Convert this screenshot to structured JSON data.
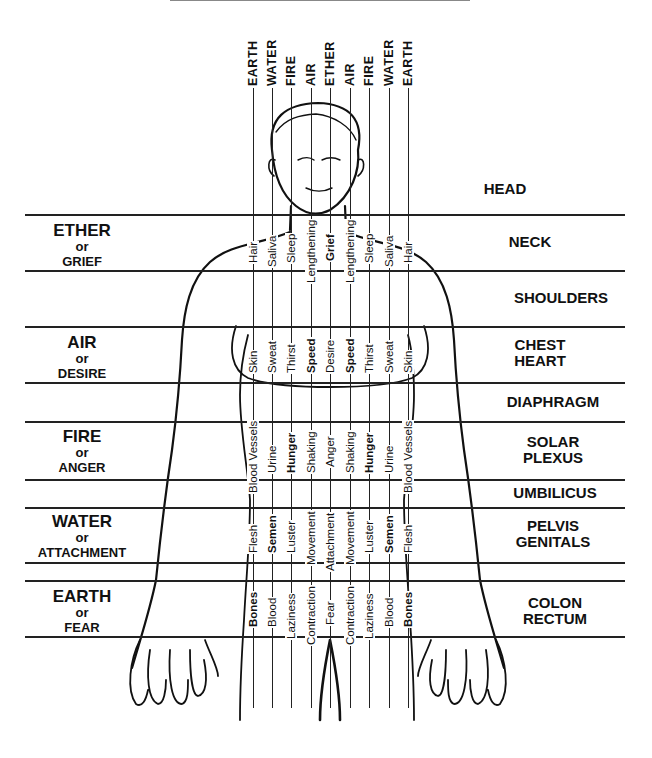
{
  "top_element_labels": [
    "EARTH",
    "WATER",
    "FIRE",
    "AIR",
    "ETHER",
    "AIR",
    "FIRE",
    "WATER",
    "EARTH"
  ],
  "columns_x": [
    253,
    272,
    291,
    311,
    330,
    350,
    369,
    389,
    408
  ],
  "horizontal_lines_y": [
    214,
    270,
    326,
    382,
    421,
    479,
    507,
    562,
    580,
    636
  ],
  "left_labels": [
    {
      "element": "ETHER",
      "or": "or",
      "emotion": "GRIEF",
      "y": 222
    },
    {
      "element": "AIR",
      "or": "or",
      "emotion": "DESIRE",
      "y": 334
    },
    {
      "element": "FIRE",
      "or": "or",
      "emotion": "ANGER",
      "y": 428
    },
    {
      "element": "WATER",
      "or": "or",
      "emotion": "ATTACHMENT",
      "y": 513
    },
    {
      "element": "EARTH",
      "or": "or",
      "emotion": "FEAR",
      "y": 588
    }
  ],
  "right_labels": [
    {
      "text": "HEAD",
      "y": 180
    },
    {
      "text": "NECK",
      "y": 234
    },
    {
      "text": "SHOULDERS",
      "y": 290
    },
    {
      "text": "CHEST\nHEART",
      "y": 338
    },
    {
      "text": "DIAPHRAGM",
      "y": 394
    },
    {
      "text": "SOLAR\nPLEXUS",
      "y": 435
    },
    {
      "text": "UMBILICUS",
      "y": 485
    },
    {
      "text": "PELVIS\nGENITALS",
      "y": 515
    },
    {
      "text": "COLON\nRECTUM",
      "y": 593
    }
  ],
  "bands": [
    {
      "name": "ether",
      "y_bottom": 268,
      "labels": [
        "Hair",
        "Saliva",
        "Sleep",
        "Lengthening",
        "Grief",
        "Lengthening",
        "Sleep",
        "Saliva",
        "Hair"
      ],
      "bold": [
        false,
        false,
        false,
        false,
        true,
        false,
        false,
        false,
        false
      ]
    },
    {
      "name": "air",
      "y_bottom": 382,
      "labels": [
        "Skin",
        "Sweat",
        "Thirst",
        "Speed",
        "Desire",
        "Speed",
        "Thirst",
        "Sweat",
        "Skin"
      ],
      "bold": [
        false,
        false,
        false,
        true,
        false,
        true,
        false,
        false,
        false
      ]
    },
    {
      "name": "fire",
      "y_bottom": 490,
      "labels": [
        "Blood Vessels",
        "Urine",
        "Hunger",
        "Shaking",
        "Anger",
        "Shaking",
        "Hunger",
        "Urine",
        "Blood Vessels"
      ],
      "bold": [
        false,
        false,
        true,
        false,
        false,
        false,
        true,
        false,
        false
      ]
    },
    {
      "name": "water",
      "y_bottom": 558,
      "labels": [
        "Flesh",
        "Semen",
        "Luster",
        "Movement",
        "Attachment",
        "Movement",
        "Luster",
        "Semen",
        "Flesh"
      ],
      "bold": [
        false,
        true,
        false,
        false,
        false,
        false,
        false,
        true,
        false
      ]
    },
    {
      "name": "earth",
      "y_bottom": 636,
      "labels": [
        "Bones",
        "Blood",
        "Laziness",
        "Contraction",
        "Fear",
        "Contraction",
        "Laziness",
        "Blood",
        "Bones"
      ],
      "bold": [
        true,
        false,
        false,
        false,
        false,
        false,
        false,
        false,
        true
      ]
    }
  ]
}
